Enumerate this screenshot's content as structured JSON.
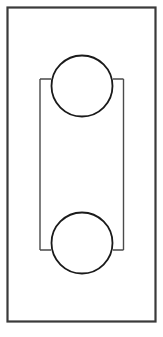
{
  "document": {
    "type": "technical-line-drawing",
    "title": "Two-pulley belt assembly elevation",
    "background_color": "#ffffff",
    "width": 163,
    "height": 337
  },
  "style": {
    "frame_stroke_color": "#3a3a3a",
    "frame_stroke_width": 2.2,
    "circle_stroke_color": "#1a1a1a",
    "circle_stroke_width": 1.8,
    "belt_stroke_color": "#4a4a4a",
    "belt_stroke_width": 1.4
  },
  "figure": {
    "frame": {
      "name": "outer-housing-rectangle",
      "x": 7.5,
      "y": 7.5,
      "width": 148,
      "height": 314
    },
    "pulleys": [
      {
        "name": "upper-pulley",
        "cx": 82,
        "cy": 86,
        "r": 30.5
      },
      {
        "name": "lower-pulley",
        "cx": 82,
        "cy": 243,
        "r": 30.5
      }
    ],
    "belt": {
      "left_run_x": 40,
      "right_run_x": 123.5,
      "top_y": 79,
      "bottom_y": 250,
      "left_stub_end_x": 51,
      "right_stub_end_x": 113,
      "paths": {
        "left_run": "M 40 79 L 51 79 M 40 79 L 40 250 M 40 250 L 51 250",
        "right_run": "M 123.5 79 L 113 79 M 123.5 79 L 123.5 250 M 123.5 250 L 113 250"
      }
    }
  }
}
